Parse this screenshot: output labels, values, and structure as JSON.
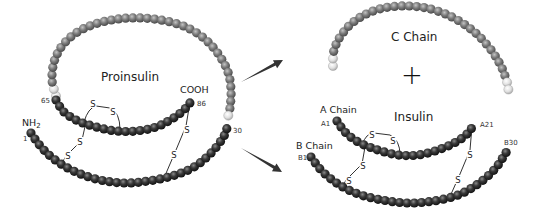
{
  "colors": {
    "dark_bead": "#2e2e2e",
    "grey_bead": "#7f7f7f",
    "light_bead": "#dcdcdc",
    "bond_line": "#333333",
    "arrow": "#333333"
  },
  "labels": {
    "proinsulin": "Proinsulin",
    "cooh": "COOH",
    "nh2_main": "NH",
    "nh2_sub": "2",
    "n65": "65",
    "n86": "86",
    "n1": "1",
    "n30": "30",
    "c_chain": "C Chain",
    "plus": "+",
    "a_chain": "A Chain",
    "b_chain": "B Chain",
    "insulin": "Insulin",
    "a1": "A1",
    "a21": "A21",
    "b1": "B1",
    "b30": "B30",
    "disulfide": "S"
  },
  "chains": [
    {
      "id": "proinsulin-c-chain",
      "color": "grey",
      "r": 4.6,
      "points": [
        [
          56,
          96
        ],
        [
          52,
          80
        ],
        [
          54,
          62
        ],
        [
          62,
          46
        ],
        [
          76,
          33
        ],
        [
          95,
          24
        ],
        [
          118,
          19
        ],
        [
          142,
          18
        ],
        [
          166,
          21
        ],
        [
          188,
          28
        ],
        [
          206,
          40
        ],
        [
          219,
          55
        ],
        [
          228,
          72
        ],
        [
          231,
          90
        ],
        [
          230,
          108
        ],
        [
          227,
          120
        ]
      ],
      "light_ends": [
        2,
        1
      ]
    },
    {
      "id": "proinsulin-a-chain",
      "color": "dark",
      "r": 4.6,
      "points": [
        [
          56,
          100
        ],
        [
          64,
          112
        ],
        [
          78,
          121
        ],
        [
          96,
          127
        ],
        [
          116,
          131
        ],
        [
          136,
          131
        ],
        [
          156,
          127
        ],
        [
          172,
          119
        ],
        [
          184,
          110
        ],
        [
          192,
          100
        ]
      ],
      "light_ends": [
        0,
        0
      ]
    },
    {
      "id": "proinsulin-b-chain",
      "color": "dark",
      "r": 4.6,
      "points": [
        [
          31,
          133
        ],
        [
          42,
          148
        ],
        [
          58,
          162
        ],
        [
          78,
          173
        ],
        [
          100,
          180
        ],
        [
          124,
          183
        ],
        [
          148,
          181
        ],
        [
          172,
          176
        ],
        [
          194,
          167
        ],
        [
          212,
          152
        ],
        [
          224,
          136
        ],
        [
          228,
          124
        ]
      ],
      "light_ends": [
        0,
        0
      ]
    },
    {
      "id": "c-chain",
      "color": "grey",
      "r": 4.6,
      "points": [
        [
          333,
          66
        ],
        [
          334,
          50
        ],
        [
          342,
          34
        ],
        [
          356,
          20
        ],
        [
          376,
          10
        ],
        [
          400,
          6
        ],
        [
          426,
          8
        ],
        [
          450,
          16
        ],
        [
          472,
          30
        ],
        [
          488,
          46
        ],
        [
          500,
          64
        ],
        [
          507,
          82
        ],
        [
          509,
          96
        ]
      ],
      "light_ends": [
        2,
        2
      ]
    },
    {
      "id": "insulin-a-chain",
      "color": "dark",
      "r": 4.6,
      "points": [
        [
          337,
          121
        ],
        [
          346,
          133
        ],
        [
          360,
          143
        ],
        [
          378,
          150
        ],
        [
          398,
          155
        ],
        [
          418,
          155
        ],
        [
          438,
          150
        ],
        [
          456,
          142
        ],
        [
          468,
          133
        ],
        [
          474,
          124
        ]
      ],
      "light_ends": [
        0,
        0
      ]
    },
    {
      "id": "insulin-b-chain",
      "color": "dark",
      "r": 4.6,
      "points": [
        [
          311,
          157
        ],
        [
          322,
          171
        ],
        [
          338,
          184
        ],
        [
          358,
          194
        ],
        [
          382,
          200
        ],
        [
          408,
          203
        ],
        [
          434,
          201
        ],
        [
          458,
          195
        ],
        [
          478,
          184
        ],
        [
          494,
          170
        ],
        [
          504,
          156
        ],
        [
          508,
          149
        ]
      ],
      "light_ends": [
        0,
        0
      ]
    }
  ],
  "bonds": [
    {
      "id": "pro-intra-a",
      "path": "M84,122 Q88,108 96,106 L110,108 Q120,112 120,130",
      "s1": [
        93,
        104
      ],
      "s2": [
        113,
        112
      ]
    },
    {
      "id": "pro-ab-1",
      "path": "M86,122 L82,140 L66,156 L62,163",
      "s1": [
        80,
        142
      ],
      "s2": [
        68,
        156
      ]
    },
    {
      "id": "pro-ab-2",
      "path": "M190,102 L186,126 L176,150 L164,178",
      "s1": [
        187,
        130
      ],
      "s2": [
        174,
        155
      ]
    },
    {
      "id": "ins-intra-a",
      "path": "M362,145 Q366,133 374,133 L390,135 Q400,140 400,155",
      "s1": [
        372,
        135
      ],
      "s2": [
        393,
        141
      ]
    },
    {
      "id": "ins-ab-1",
      "path": "M365,147 L362,164 L346,180 L342,188",
      "s1": [
        363,
        166
      ],
      "s2": [
        349,
        181
      ]
    },
    {
      "id": "ins-ab-2",
      "path": "M472,126 L470,150 L460,174 L448,201",
      "s1": [
        470,
        155
      ],
      "s2": [
        458,
        180
      ]
    }
  ],
  "arrows": [
    {
      "id": "arrow-to-c-chain",
      "from": [
        241,
        82
      ],
      "to": [
        283,
        60
      ]
    },
    {
      "id": "arrow-to-insulin",
      "from": [
        241,
        148
      ],
      "to": [
        282,
        172
      ]
    }
  ]
}
